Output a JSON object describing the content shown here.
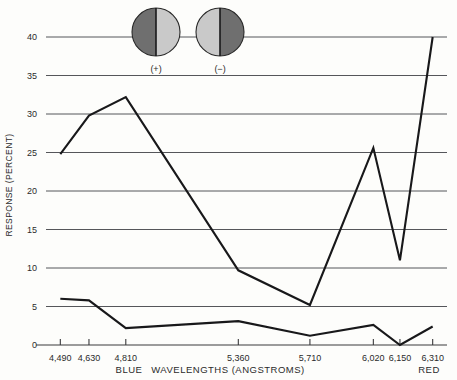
{
  "chart_data": {
    "type": "line",
    "title": "",
    "xlabel": "WAVELENGTHS (ANGSTROMS)",
    "ylabel": "RESPONSE (PERCENT)",
    "x": [
      4490,
      4630,
      4810,
      5360,
      5710,
      6020,
      6150,
      6310
    ],
    "xtick_labels": [
      "4,490",
      "4,630",
      "4,810",
      "5,360",
      "5,710",
      "6,020",
      "6,150",
      "6,310"
    ],
    "ytick_labels": [
      "0",
      "5",
      "10",
      "15",
      "20",
      "25",
      "30",
      "35",
      "40"
    ],
    "ytick_values": [
      0,
      5,
      10,
      15,
      20,
      25,
      30,
      35,
      40
    ],
    "ylim": [
      0,
      40
    ],
    "xlim": [
      4420,
      6380
    ],
    "grid": true,
    "legend_position": "top",
    "x_axis_end_labels": {
      "left": "BLUE",
      "right": "RED"
    },
    "series": [
      {
        "name": "(+)",
        "values": [
          24.8,
          29.8,
          32.2,
          9.7,
          5.2,
          25.6,
          11.0,
          40.0
        ]
      },
      {
        "name": "(-)",
        "values": [
          6.0,
          5.8,
          2.2,
          3.1,
          1.2,
          2.6,
          0.0,
          2.4
        ]
      }
    ]
  },
  "legend": {
    "items": [
      {
        "label": "(+)",
        "icon": "half-circle-dark-left",
        "left_color": "#6f6f6f",
        "right_color": "#c9c9c9"
      },
      {
        "label": "(−)",
        "icon": "half-circle-light-left",
        "left_color": "#c9c9c9",
        "right_color": "#6f6f6f"
      }
    ]
  },
  "colors": {
    "series_line": "#18181a",
    "gridline": "#55565a",
    "axis": "#3a3a3c",
    "background": "#fdfdfb"
  }
}
